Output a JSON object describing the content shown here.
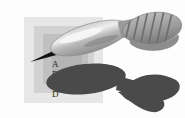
{
  "figure": {
    "width_px": 185,
    "height_px": 118
  },
  "layers": {
    "outer": {
      "name": "outer-layer",
      "color": "#e7e7e7"
    },
    "mid": {
      "name": "middle-layer",
      "color": "#d2d2d2"
    },
    "inner": {
      "name": "inner-layer",
      "color": "#c0c0c0"
    },
    "core": {
      "name": "core-layer",
      "color": "#b4b4b4"
    }
  },
  "labels": [
    {
      "id": "a",
      "text": "A"
    },
    {
      "id": "b",
      "text": "B"
    },
    {
      "id": "c",
      "text": "C"
    },
    {
      "id": "d",
      "text": "D"
    }
  ],
  "dart": {
    "tip_color": "#111111",
    "body_color": "#b6b6b6",
    "highlight_color": "#f4f4f4",
    "fletching_color": "#a3a3a3",
    "stripe_color": "#6e6e6e",
    "outline_color": "#8a8a8a"
  },
  "shadow": {
    "color": "#4a4a4a"
  }
}
